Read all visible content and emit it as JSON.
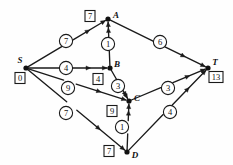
{
  "figure": {
    "type": "directed-weighted-graph"
  },
  "chart_data": {
    "type": "diagram",
    "title": "",
    "nodes": [
      {
        "id": "S",
        "letter": "S",
        "label": "0",
        "x": 26,
        "y": 68,
        "letter_dx": -6,
        "letter_dy": -8,
        "box_dx": -6,
        "box_dy": 10
      },
      {
        "id": "A",
        "letter": "A",
        "label": "7",
        "x": 108,
        "y": 19,
        "letter_dx": 8,
        "letter_dy": -4,
        "box_dx": -18,
        "box_dy": -3
      },
      {
        "id": "B",
        "letter": "B",
        "label": "4",
        "x": 110,
        "y": 68,
        "letter_dx": 7,
        "letter_dy": -4,
        "box_dx": -12,
        "box_dy": 11
      },
      {
        "id": "C",
        "letter": "C",
        "label": "9",
        "x": 129,
        "y": 101,
        "letter_dx": 8,
        "letter_dy": -3,
        "box_dx": -17,
        "box_dy": 10
      },
      {
        "id": "D",
        "letter": "D",
        "label": "7",
        "x": 127,
        "y": 152,
        "letter_dx": 8,
        "letter_dy": 3,
        "box_dx": -18,
        "box_dy": -1
      },
      {
        "id": "T",
        "letter": "T",
        "label": "13",
        "x": 208,
        "y": 68,
        "letter_dx": 7,
        "letter_dy": -6,
        "box_dx": 8,
        "box_dy": 9
      }
    ],
    "edges": [
      {
        "from": "S",
        "to": "A",
        "weight": "7",
        "wx": 66,
        "wy": 41
      },
      {
        "from": "S",
        "to": "B",
        "weight": "4",
        "wx": 66,
        "wy": 68
      },
      {
        "from": "S",
        "to": "C",
        "weight": "9",
        "wx": 68,
        "wy": 88
      },
      {
        "from": "S",
        "to": "D",
        "weight": "7",
        "wx": 66,
        "wy": 113
      },
      {
        "from": "B",
        "to": "A",
        "weight": "1",
        "wx": 108,
        "wy": 44
      },
      {
        "from": "A",
        "to": "T",
        "weight": "6",
        "wx": 160,
        "wy": 42
      },
      {
        "from": "B",
        "to": "C",
        "weight": "3",
        "wx": 118,
        "wy": 86
      },
      {
        "from": "C",
        "to": "T",
        "weight": "3",
        "wx": 168,
        "wy": 88
      },
      {
        "from": "D",
        "to": "C",
        "weight": "1",
        "wx": 122,
        "wy": 127
      },
      {
        "from": "D",
        "to": "T",
        "weight": "4",
        "wx": 170,
        "wy": 112
      }
    ],
    "source": "S",
    "target": "T",
    "legend": []
  }
}
